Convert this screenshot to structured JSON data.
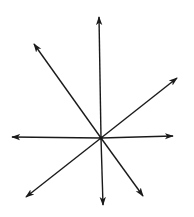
{
  "diagram": {
    "type": "vector-star",
    "center": [
      101,
      138
    ],
    "stroke_color": "#1a1a1a",
    "arrows": [
      {
        "name": "up",
        "tip": [
          99,
          17
        ]
      },
      {
        "name": "upper-left",
        "tip": [
          34,
          44
        ]
      },
      {
        "name": "upper-right",
        "tip": [
          177,
          78
        ]
      },
      {
        "name": "left",
        "tip": [
          12,
          137
        ]
      },
      {
        "name": "right",
        "tip": [
          173,
          136
        ]
      },
      {
        "name": "lower-left",
        "tip": [
          26,
          197
        ]
      },
      {
        "name": "down",
        "tip": [
          103,
          205
        ]
      },
      {
        "name": "lower-right",
        "tip": [
          143,
          196
        ]
      }
    ]
  }
}
